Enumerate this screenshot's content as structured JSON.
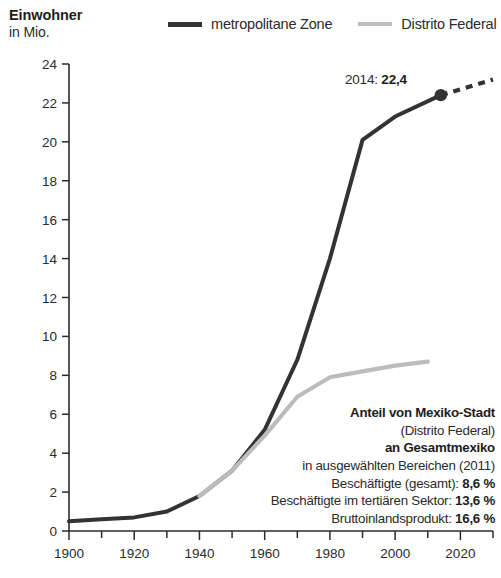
{
  "axis_title": {
    "main": "Einwohner",
    "sub": "in Mio."
  },
  "legend": [
    {
      "label": "metropolitane Zone",
      "color": "#333333"
    },
    {
      "label": "Distrito Federal",
      "color": "#bcbcbc"
    }
  ],
  "callout": {
    "prefix": "2014: ",
    "value": "22,4",
    "x": 2014,
    "y": 22.4
  },
  "stats": {
    "title_line1": "Anteil von Mexiko-Stadt",
    "title_line2": "(Distrito Federal)",
    "title_line3": "an Gesamtmexiko",
    "title_line4": "in ausgewählten Bereichen (2011)",
    "rows": [
      {
        "label": "Beschäftigte (gesamt): ",
        "value": "8,6 %"
      },
      {
        "label": "Beschäftigte im tertiären Sektor: ",
        "value": "13,6 %"
      },
      {
        "label": "Bruttoinlandsprodukt: ",
        "value": "16,6 %"
      }
    ]
  },
  "chart_data": {
    "type": "line",
    "title": "Einwohner in Mio.",
    "xlabel": "",
    "ylabel": "Einwohner in Mio.",
    "xlim": [
      1900,
      2030
    ],
    "ylim": [
      0,
      24
    ],
    "ytick_step": 2,
    "xtick_major_step": 20,
    "xtick_minor_step": 10,
    "grid": false,
    "legend_position": "top",
    "yticks": [
      0,
      2,
      4,
      6,
      8,
      10,
      12,
      14,
      16,
      18,
      20,
      22,
      24
    ],
    "xticks": [
      1900,
      1920,
      1940,
      1960,
      1980,
      2000,
      2020
    ],
    "series": [
      {
        "name": "metropolitane Zone",
        "color": "#333333",
        "x": [
          1900,
          1910,
          1920,
          1930,
          1940,
          1950,
          1960,
          1970,
          1980,
          1990,
          2000,
          2014
        ],
        "values": [
          0.5,
          0.6,
          0.7,
          1.0,
          1.8,
          3.1,
          5.2,
          8.8,
          14.0,
          20.1,
          21.3,
          22.4
        ]
      },
      {
        "name": "Distrito Federal",
        "color": "#bcbcbc",
        "x": [
          1940,
          1950,
          1960,
          1970,
          1980,
          1990,
          2000,
          2010
        ],
        "values": [
          1.8,
          3.1,
          4.9,
          6.9,
          7.9,
          8.2,
          8.5,
          8.7
        ]
      },
      {
        "name": "metropolitane Zone (Prognose)",
        "color": "#333333",
        "style": "dashed",
        "x": [
          2014,
          2030
        ],
        "values": [
          22.4,
          23.2
        ]
      }
    ],
    "markers": [
      {
        "series": "metropolitane Zone",
        "x": 2014,
        "y": 22.4,
        "label": "2014: 22,4"
      }
    ]
  }
}
